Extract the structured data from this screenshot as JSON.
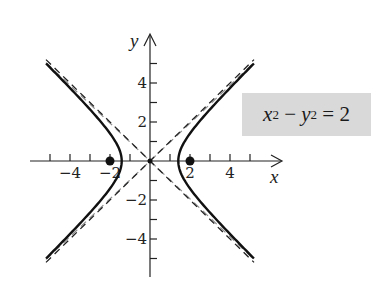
{
  "chart_data": {
    "type": "line",
    "title": "",
    "equation": "x^2 - y^2 = 2",
    "equation_parts": {
      "x": "x",
      "y": "y",
      "exp": "2",
      "minus": " − ",
      "equals": " = ",
      "rhs": "2"
    },
    "xlabel": "x",
    "ylabel": "y",
    "xlim": [
      -5.5,
      6.5
    ],
    "ylim": [
      -5.5,
      6.5
    ],
    "x_ticks": [
      -5,
      -4,
      -3,
      -2,
      -1,
      1,
      2,
      3,
      4,
      5
    ],
    "y_ticks": [
      -5,
      -4,
      -3,
      -2,
      -1,
      1,
      2,
      3,
      4,
      5
    ],
    "x_tick_labels": [
      {
        "value": -4,
        "label": "−4"
      },
      {
        "value": -2,
        "label": "−2"
      },
      {
        "value": 2,
        "label": "2"
      },
      {
        "value": 4,
        "label": "4"
      }
    ],
    "y_tick_labels": [
      {
        "value": 4,
        "label": "4"
      },
      {
        "value": 2,
        "label": "2"
      },
      {
        "value": -2,
        "label": "−2"
      },
      {
        "value": -4,
        "label": "−4"
      }
    ],
    "grid": false,
    "series": [
      {
        "name": "hyperbola right branch",
        "style": "solid",
        "curve": "x = sqrt(2 + y^2)",
        "y_range": [
          -5,
          5
        ]
      },
      {
        "name": "hyperbola left branch",
        "style": "solid",
        "curve": "x = -sqrt(2 + y^2)",
        "y_range": [
          -5,
          5
        ]
      },
      {
        "name": "asymptote y = x",
        "style": "dashed",
        "x_range": [
          -5.2,
          5.2
        ]
      },
      {
        "name": "asymptote y = -x",
        "style": "dashed",
        "x_range": [
          -5.2,
          5.2
        ]
      }
    ],
    "points": [
      {
        "name": "focus left",
        "x": -2,
        "y": 0
      },
      {
        "name": "focus right",
        "x": 2,
        "y": 0
      },
      {
        "name": "center",
        "x": 0,
        "y": 0
      }
    ],
    "vertices": [
      [
        -1.414,
        0
      ],
      [
        1.414,
        0
      ]
    ]
  }
}
